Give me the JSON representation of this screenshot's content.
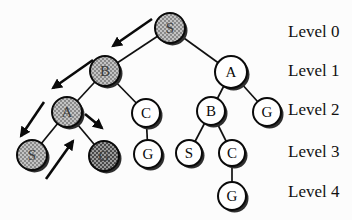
{
  "figure": {
    "nodes": [
      {
        "label": "S",
        "level": 0,
        "shade": "gray"
      },
      {
        "label": "B",
        "level": 1,
        "shade": "gray"
      },
      {
        "label": "A",
        "level": 1,
        "shade": "white"
      },
      {
        "label": "A",
        "level": 2,
        "shade": "gray"
      },
      {
        "label": "C",
        "level": 2,
        "shade": "white"
      },
      {
        "label": "B",
        "level": 2,
        "shade": "white"
      },
      {
        "label": "G",
        "level": 2,
        "shade": "white"
      },
      {
        "label": "S",
        "level": 3,
        "shade": "gray"
      },
      {
        "label": "G",
        "level": 3,
        "shade": "dark-gray"
      },
      {
        "label": "G",
        "level": 3,
        "shade": "white"
      },
      {
        "label": "S",
        "level": 3,
        "shade": "white"
      },
      {
        "label": "C",
        "level": 3,
        "shade": "white"
      },
      {
        "label": "G",
        "level": 4,
        "shade": "white"
      }
    ],
    "edges": [
      [
        0,
        1
      ],
      [
        0,
        2
      ],
      [
        1,
        3
      ],
      [
        1,
        4
      ],
      [
        2,
        5
      ],
      [
        2,
        6
      ],
      [
        3,
        7
      ],
      [
        3,
        8
      ],
      [
        4,
        9
      ],
      [
        5,
        10
      ],
      [
        5,
        11
      ],
      [
        11,
        12
      ]
    ],
    "traversal_arrows": [
      {
        "from": 0,
        "to": 1
      },
      {
        "from": 1,
        "to": 3
      },
      {
        "from": 3,
        "to": 7
      },
      {
        "from": 7,
        "to": 3,
        "type": "backtrack"
      },
      {
        "from": 3,
        "to": 8
      }
    ],
    "level_labels": [
      {
        "label": "Level 0"
      },
      {
        "label": "Level 1"
      },
      {
        "label": "Level 2"
      },
      {
        "label": "Level 3"
      },
      {
        "label": "Level 4"
      }
    ],
    "colors": {
      "background": "#fcfcfc",
      "node_fill": "#ffffff",
      "node_stroke": "#0a0a0a",
      "shaded_fill": "#b5b5b5",
      "dark_shaded_fill": "#8e8e8e",
      "arrow": "#0a0a0a",
      "shadow": "#2e2e2e"
    }
  }
}
